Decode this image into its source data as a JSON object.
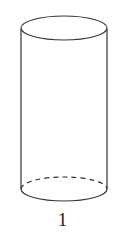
{
  "figure": {
    "shape": "cylinder",
    "stroke_color": "#333333",
    "background": "#ffffff",
    "hidden_edge_style": "dashed"
  },
  "label": "1"
}
